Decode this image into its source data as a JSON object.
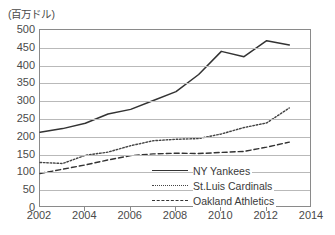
{
  "unit_label": "(百万ドル)",
  "chart_data": {
    "type": "line",
    "title": "",
    "xlabel": "",
    "ylabel": "(百万ドル)",
    "xlim": [
      2002,
      2014
    ],
    "ylim": [
      0,
      500
    ],
    "ytick_step": 50,
    "xtick_step": 2,
    "grid": "horizontal",
    "legend_position": "bottom-right",
    "yticks": [
      0,
      50,
      100,
      150,
      200,
      250,
      300,
      350,
      400,
      450,
      500
    ],
    "xticks": [
      2002,
      2004,
      2006,
      2008,
      2010,
      2012,
      2014
    ],
    "x": [
      2002,
      2003,
      2004,
      2005,
      2006,
      2007,
      2008,
      2009,
      2010,
      2011,
      2012,
      2013
    ],
    "series": [
      {
        "name": "NY Yankees",
        "style": "solid",
        "color": "#333333",
        "values": [
          213,
          223,
          238,
          264,
          277,
          302,
          327,
          375,
          440,
          425,
          470,
          458
        ]
      },
      {
        "name": "St.Luis Cardinals",
        "style": "dotted",
        "color": "#444444",
        "values": [
          128,
          125,
          148,
          157,
          175,
          189,
          193,
          195,
          208,
          226,
          239,
          281
        ]
      },
      {
        "name": "Oakland Athletics",
        "style": "dashed",
        "color": "#333333",
        "values": [
          97,
          109,
          121,
          135,
          147,
          152,
          154,
          153,
          156,
          159,
          171,
          185
        ]
      }
    ]
  }
}
